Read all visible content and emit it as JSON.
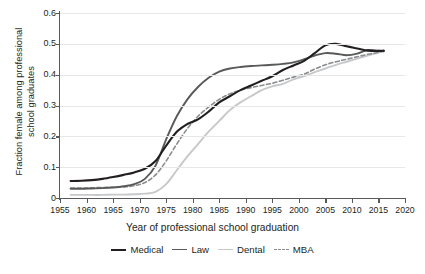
{
  "chart_data": {
    "type": "line",
    "title": "",
    "xlabel": "Year of professional school graduation",
    "ylabel_line1": "Fraction female among professional",
    "ylabel_line2": "school graduates",
    "xlim": [
      1955,
      2020
    ],
    "ylim": [
      0,
      0.6
    ],
    "xticks": [
      1955,
      1960,
      1965,
      1970,
      1975,
      1980,
      1985,
      1990,
      1995,
      2000,
      2005,
      2010,
      2015,
      2020
    ],
    "yticks": [
      "0",
      "0.1",
      "0.2",
      "0.3",
      "0.4",
      "0.5",
      "0.6"
    ],
    "ytick_values": [
      0,
      0.1,
      0.2,
      0.3,
      0.4,
      0.5,
      0.6
    ],
    "grid": "horizontal",
    "legend_position": "bottom",
    "series": [
      {
        "name": "Medical",
        "color": "#231f20",
        "style": "solid",
        "width": 2.1,
        "x": [
          1957,
          1959,
          1961,
          1963,
          1965,
          1967,
          1969,
          1971,
          1973,
          1975,
          1977,
          1979,
          1981,
          1983,
          1985,
          1987,
          1989,
          1991,
          1993,
          1995,
          1997,
          1999,
          2001,
          2003,
          2005,
          2007,
          2009,
          2011,
          2013,
          2015,
          2016
        ],
        "y": [
          0.055,
          0.056,
          0.058,
          0.062,
          0.068,
          0.075,
          0.083,
          0.095,
          0.12,
          0.17,
          0.215,
          0.24,
          0.255,
          0.28,
          0.31,
          0.33,
          0.35,
          0.365,
          0.38,
          0.395,
          0.415,
          0.43,
          0.445,
          0.47,
          0.495,
          0.5,
          0.492,
          0.485,
          0.478,
          0.477,
          0.478
        ]
      },
      {
        "name": "Law",
        "color": "#58595b",
        "style": "solid",
        "width": 1.9,
        "x": [
          1957,
          1959,
          1961,
          1963,
          1965,
          1967,
          1969,
          1971,
          1973,
          1975,
          1977,
          1979,
          1981,
          1983,
          1985,
          1987,
          1989,
          1991,
          1993,
          1995,
          1997,
          1999,
          2001,
          2003,
          2005,
          2007,
          2009,
          2011,
          2013,
          2015,
          2016
        ],
        "y": [
          0.03,
          0.03,
          0.031,
          0.032,
          0.034,
          0.038,
          0.045,
          0.062,
          0.105,
          0.19,
          0.265,
          0.32,
          0.36,
          0.39,
          0.41,
          0.42,
          0.425,
          0.428,
          0.43,
          0.432,
          0.435,
          0.44,
          0.45,
          0.462,
          0.47,
          0.468,
          0.463,
          0.468,
          0.48,
          0.478,
          0.476
        ]
      },
      {
        "name": "Dental",
        "color": "#c7c8ca",
        "style": "solid",
        "width": 1.9,
        "x": [
          1957,
          1959,
          1961,
          1963,
          1965,
          1967,
          1969,
          1971,
          1973,
          1975,
          1977,
          1979,
          1981,
          1983,
          1985,
          1987,
          1989,
          1991,
          1993,
          1995,
          1997,
          1999,
          2001,
          2003,
          2005,
          2007,
          2009,
          2011,
          2013,
          2015,
          2016
        ],
        "y": [
          0.01,
          0.01,
          0.01,
          0.01,
          0.011,
          0.011,
          0.012,
          0.014,
          0.02,
          0.045,
          0.09,
          0.135,
          0.175,
          0.215,
          0.25,
          0.285,
          0.31,
          0.33,
          0.35,
          0.362,
          0.37,
          0.385,
          0.395,
          0.408,
          0.42,
          0.432,
          0.442,
          0.452,
          0.462,
          0.472,
          0.478
        ]
      },
      {
        "name": "MBA",
        "color": "#8a8c8e",
        "style": "dashed",
        "width": 1.6,
        "x": [
          1957,
          1959,
          1961,
          1963,
          1965,
          1967,
          1969,
          1971,
          1973,
          1975,
          1977,
          1979,
          1981,
          1983,
          1985,
          1987,
          1989,
          1991,
          1993,
          1995,
          1997,
          1999,
          2001,
          2003,
          2005,
          2007,
          2009,
          2011,
          2013,
          2015,
          2016
        ],
        "y": [
          0.032,
          0.032,
          0.033,
          0.034,
          0.035,
          0.036,
          0.04,
          0.05,
          0.075,
          0.12,
          0.175,
          0.225,
          0.265,
          0.295,
          0.32,
          0.338,
          0.35,
          0.358,
          0.365,
          0.372,
          0.382,
          0.392,
          0.402,
          0.418,
          0.432,
          0.442,
          0.45,
          0.458,
          0.466,
          0.472,
          0.476
        ]
      }
    ]
  },
  "legend": {
    "items": [
      {
        "label": "Medical"
      },
      {
        "label": "Law"
      },
      {
        "label": "Dental"
      },
      {
        "label": "MBA"
      }
    ]
  }
}
